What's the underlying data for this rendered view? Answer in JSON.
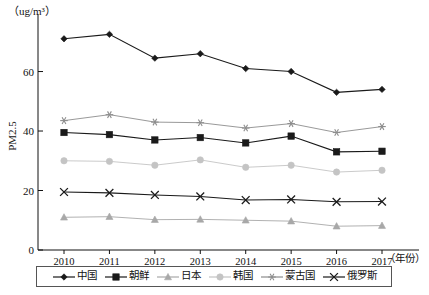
{
  "axes": {
    "y_unit": "（ug/m³）",
    "y_title": "PM2.5",
    "x_unit": "（年份）",
    "y_ticks": [
      "0",
      "20",
      "40",
      "60"
    ],
    "x_ticks": [
      "2010",
      "2011",
      "2012",
      "2013",
      "2014",
      "2015",
      "2016",
      "2017"
    ]
  },
  "legend": {
    "items": [
      {
        "label": "中国",
        "marker": "diamond-marker",
        "color": "#1a1a1a"
      },
      {
        "label": "朝鲜",
        "marker": "square-marker",
        "color": "#1a1a1a"
      },
      {
        "label": "日本",
        "marker": "triangle-marker",
        "color": "#a8a8a8"
      },
      {
        "label": "韩国",
        "marker": "circle-marker",
        "color": "#c4c4c4"
      },
      {
        "label": "蒙古国",
        "marker": "star-marker",
        "color": "#8d8d8d"
      },
      {
        "label": "俄罗斯",
        "marker": "cross-marker",
        "color": "#1a1a1a"
      }
    ]
  },
  "chart_data": {
    "type": "line",
    "title": "",
    "xlabel": "（年份）",
    "ylabel": "PM2.5",
    "yunit": "（ug/m³）",
    "x": [
      "2010",
      "2011",
      "2012",
      "2013",
      "2014",
      "2015",
      "2016",
      "2017"
    ],
    "ylim": [
      0,
      78
    ],
    "yticks": [
      0,
      20,
      40,
      60
    ],
    "grid": false,
    "legend_position": "bottom",
    "series": [
      {
        "name": "中国",
        "marker": "diamond",
        "color": "#1a1a1a",
        "values": [
          71,
          72.5,
          64.5,
          66,
          61,
          60,
          53,
          54
        ]
      },
      {
        "name": "朝鲜",
        "marker": "square",
        "color": "#1a1a1a",
        "values": [
          39.5,
          38.8,
          37,
          37.8,
          36,
          38.3,
          33,
          33.2
        ]
      },
      {
        "name": "日本",
        "marker": "triangle",
        "color": "#a8a8a8",
        "values": [
          11,
          11.2,
          10.2,
          10.3,
          10,
          9.7,
          8,
          8.2
        ]
      },
      {
        "name": "韩国",
        "marker": "circle",
        "color": "#c4c4c4",
        "values": [
          30,
          29.8,
          28.5,
          30.3,
          27.8,
          28.5,
          26.2,
          26.8
        ]
      },
      {
        "name": "蒙古国",
        "marker": "star",
        "color": "#8d8d8d",
        "values": [
          43.5,
          45.5,
          43,
          42.8,
          41,
          42.5,
          39.5,
          41.5
        ]
      },
      {
        "name": "俄罗斯",
        "marker": "cross",
        "color": "#1a1a1a",
        "values": [
          19.5,
          19.2,
          18.5,
          18,
          16.8,
          17,
          16.2,
          16.3
        ]
      }
    ]
  }
}
